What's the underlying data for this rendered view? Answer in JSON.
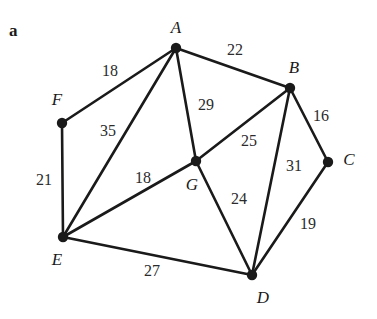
{
  "figure": {
    "part_label": "a",
    "part_label_x": 9,
    "part_label_y": 22,
    "width": 377,
    "height": 319,
    "background": "#ffffff",
    "stroke_color": "#1a1a1a",
    "node_color": "#1a1a1a",
    "edge_width": 2.6,
    "node_radius": 5.2
  },
  "chart_data": {
    "type": "diagram",
    "subtype": "weighted-undirected-graph",
    "title": "a",
    "xlabel": "",
    "ylabel": "",
    "nodes": [
      {
        "id": "A",
        "label": "A",
        "x": 176,
        "y": 48,
        "label_x": 176,
        "label_y": 27
      },
      {
        "id": "B",
        "label": "B",
        "x": 290,
        "y": 88,
        "label_x": 294,
        "label_y": 67
      },
      {
        "id": "C",
        "label": "C",
        "x": 328,
        "y": 162,
        "label_x": 349,
        "label_y": 159
      },
      {
        "id": "D",
        "label": "D",
        "x": 252,
        "y": 275,
        "label_x": 263,
        "label_y": 297
      },
      {
        "id": "E",
        "label": "E",
        "x": 63,
        "y": 237,
        "label_x": 57,
        "label_y": 259
      },
      {
        "id": "F",
        "label": "F",
        "x": 62,
        "y": 123,
        "label_x": 57,
        "label_y": 99
      },
      {
        "id": "G",
        "label": "G",
        "x": 196,
        "y": 161,
        "label_x": 192,
        "label_y": 184
      }
    ],
    "edges": [
      {
        "from": "F",
        "to": "A",
        "weight": 18,
        "label_x": 110,
        "label_y": 71
      },
      {
        "from": "A",
        "to": "B",
        "weight": 22,
        "label_x": 235,
        "label_y": 50
      },
      {
        "from": "A",
        "to": "G",
        "weight": 29,
        "label_x": 206,
        "label_y": 105
      },
      {
        "from": "A",
        "to": "E",
        "weight": 35,
        "label_x": 108,
        "label_y": 131
      },
      {
        "from": "B",
        "to": "C",
        "weight": 16,
        "label_x": 321,
        "label_y": 116
      },
      {
        "from": "B",
        "to": "G",
        "weight": 25,
        "label_x": 249,
        "label_y": 141
      },
      {
        "from": "B",
        "to": "D",
        "weight": 31,
        "label_x": 294,
        "label_y": 166
      },
      {
        "from": "C",
        "to": "D",
        "weight": 19,
        "label_x": 308,
        "label_y": 224
      },
      {
        "from": "G",
        "to": "D",
        "weight": 24,
        "label_x": 239,
        "label_y": 199
      },
      {
        "from": "G",
        "to": "E",
        "weight": 18,
        "label_x": 143,
        "label_y": 178
      },
      {
        "from": "E",
        "to": "F",
        "weight": 21,
        "label_x": 44,
        "label_y": 180
      },
      {
        "from": "E",
        "to": "D",
        "weight": 27,
        "label_x": 152,
        "label_y": 271
      }
    ]
  }
}
